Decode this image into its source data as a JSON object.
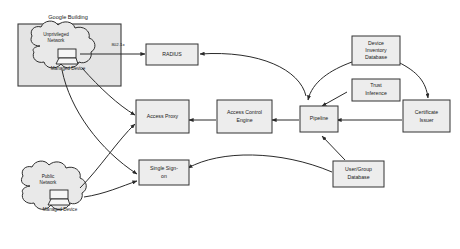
{
  "diagram": {
    "background_color": "#ffffff",
    "box_fill_color": "#ededed",
    "box_stroke_color": "#333333",
    "zone_fill_color": "#e4e4e4",
    "cloud_fill_color": "#e9e9e9",
    "edge_color": "#2a2a2a"
  },
  "zones": [
    {
      "id": "google-building",
      "label": "Google Building"
    }
  ],
  "clouds": [
    {
      "id": "unprivileged-network",
      "label_line1": "Unprivileged",
      "label_line2": "Network",
      "device_label": "Managed Device"
    },
    {
      "id": "public-network",
      "label_line1": "Public",
      "label_line2": "Network",
      "device_label": "Managed Device"
    }
  ],
  "nodes": [
    {
      "id": "radius",
      "label_line1": "RADIUS",
      "label_line2": ""
    },
    {
      "id": "access-proxy",
      "label_line1": "Access Proxy",
      "label_line2": ""
    },
    {
      "id": "access-control-engine",
      "label_line1": "Access Control",
      "label_line2": "Engine"
    },
    {
      "id": "pipeline",
      "label_line1": "Pipeline",
      "label_line2": ""
    },
    {
      "id": "single-sign-on",
      "label_line1": "Single Sign-",
      "label_line2": "on"
    },
    {
      "id": "device-inventory-database",
      "label_line1": "Device",
      "label_line2": "Inventory",
      "label_line3": "Database"
    },
    {
      "id": "trust-inference",
      "label_line1": "Trust",
      "label_line2": "Inference"
    },
    {
      "id": "certificate-issuer",
      "label_line1": "Certificate",
      "label_line2": "Issuer"
    },
    {
      "id": "user-group-database",
      "label_line1": "User/Group",
      "label_line2": "Database"
    }
  ],
  "edge_labels": [
    {
      "id": "dot1x",
      "text": "802.1x"
    }
  ]
}
